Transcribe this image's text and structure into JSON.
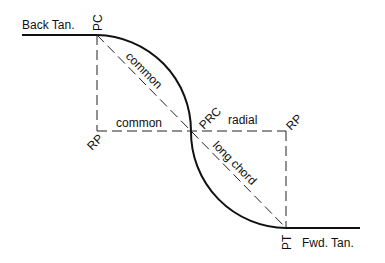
{
  "diagram": {
    "type": "reverse-curve",
    "colors": {
      "line": "#111111",
      "background": "#ffffff"
    },
    "labels": {
      "back_tangent": "Back Tan.",
      "forward_tangent": "Fwd. Tan.",
      "pc": "PC",
      "prc": "PRC",
      "pt": "PT",
      "rp_left": "RP",
      "rp_right": "RP",
      "common_chord": "common",
      "common_radius": "common",
      "radial": "radial",
      "long_chord": "long chord"
    }
  }
}
